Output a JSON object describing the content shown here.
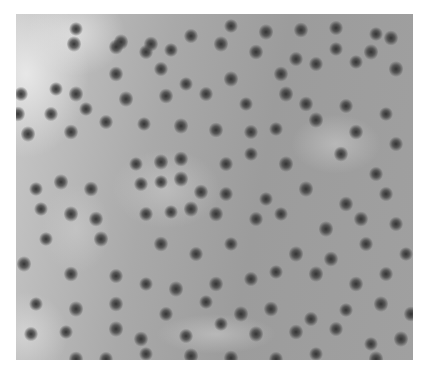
{
  "image": {
    "description": "Grayscale scanning-probe microscopy image showing dark blurred atomic/molecular features on a lighter gray surface",
    "colors": {
      "background": "#ffffff",
      "surface_light": "#c8c8c8",
      "surface_mid": "#a0a0a0",
      "feature_dark": "#2d2d2d"
    }
  }
}
